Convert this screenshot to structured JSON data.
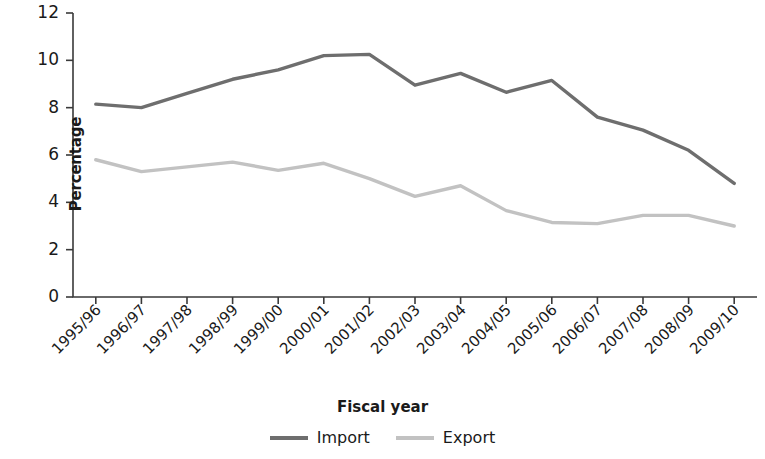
{
  "chart_data": {
    "type": "line",
    "title": "",
    "xlabel": "Fiscal year",
    "ylabel": "Percentage",
    "ylim": [
      0,
      12
    ],
    "yticks": [
      0,
      2,
      4,
      6,
      8,
      10,
      12
    ],
    "grid": false,
    "legend_position": "bottom",
    "categories": [
      "1995/96",
      "1996/97",
      "1997/98",
      "1998/99",
      "1999/00",
      "2000/01",
      "2001/02",
      "2002/03",
      "2003/04",
      "2004/05",
      "2005/06",
      "2006/07",
      "2007/08",
      "2008/09",
      "2009/10"
    ],
    "series": [
      {
        "name": "Import",
        "color": "#6e6e6e",
        "values": [
          8.15,
          8.0,
          8.6,
          9.2,
          9.6,
          10.2,
          10.25,
          8.95,
          9.45,
          8.65,
          9.15,
          7.6,
          7.05,
          6.2,
          4.8
        ]
      },
      {
        "name": "Export",
        "color": "#c2c2c2",
        "values": [
          5.8,
          5.3,
          5.5,
          5.7,
          5.35,
          5.65,
          5.0,
          4.25,
          4.7,
          3.65,
          3.15,
          3.1,
          3.45,
          3.45,
          3.0
        ]
      }
    ]
  },
  "axis": {
    "y_title": "Percentage",
    "x_title": "Fiscal year",
    "y_tick_labels": [
      "12",
      "10",
      "8",
      "6",
      "4",
      "2",
      "0"
    ],
    "axis_color": "#3a3a3a"
  },
  "legend": {
    "items": [
      {
        "label": "Import",
        "color": "#6e6e6e"
      },
      {
        "label": "Export",
        "color": "#c2c2c2"
      }
    ]
  }
}
